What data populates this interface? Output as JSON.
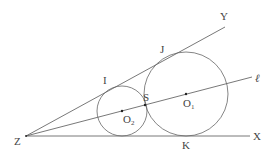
{
  "diagram": {
    "title": "",
    "points": {
      "Z": {
        "label": "Z",
        "x": 26,
        "y": 136
      },
      "X": {
        "label": "X",
        "x": 250,
        "y": 136
      },
      "Y": {
        "label": "Y",
        "x": 225,
        "y": 27
      },
      "ell": {
        "label": "ℓ",
        "x": 252,
        "y": 77
      },
      "I": {
        "label": "I",
        "x": 110,
        "y": 86
      },
      "J": {
        "label": "J",
        "x": 167,
        "y": 57
      },
      "S": {
        "label": "S",
        "x": 145,
        "y": 105
      },
      "K": {
        "label": "K",
        "x": 186,
        "y": 136
      }
    },
    "circles": [
      {
        "name": "small-circle",
        "center_label": "O",
        "center_sub": "2",
        "cx": 122,
        "cy": 111,
        "r": 25
      },
      {
        "name": "large-circle",
        "center_label": "O",
        "center_sub": "1",
        "cx": 186,
        "cy": 94,
        "r": 42
      }
    ],
    "labels": {
      "Z": "Z",
      "X": "X",
      "Y": "Y",
      "ell": "ℓ",
      "I": "I",
      "J": "J",
      "S": "S",
      "K": "K",
      "O1_main": "O",
      "O1_sub": "1",
      "O2_main": "O",
      "O2_sub": "2"
    }
  }
}
